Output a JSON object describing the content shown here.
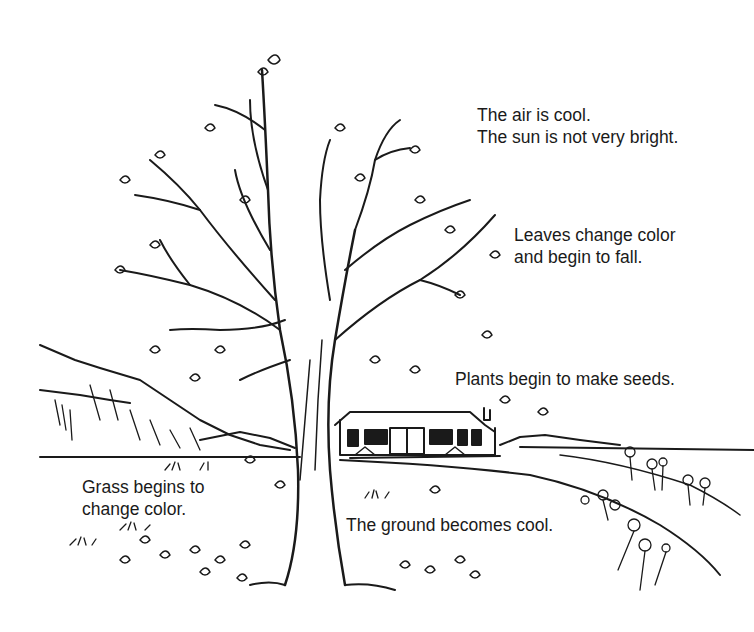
{
  "scene": {
    "subject": "autumn landscape illustration",
    "elements": [
      "bare tree with few leaves",
      "falling leaves",
      "house",
      "hills",
      "flowers",
      "grass"
    ],
    "colors": {
      "ink": "#1a1a1a",
      "background": "#ffffff"
    }
  },
  "labels": {
    "air": {
      "line1": "The air is cool.",
      "line2": "The sun is not very bright."
    },
    "leaves": {
      "line1": "Leaves change color",
      "line2": "and begin to fall."
    },
    "plants": {
      "line1": "Plants begin to make seeds."
    },
    "grass": {
      "line1": "Grass begins to",
      "line2": "change color."
    },
    "ground": {
      "line1": "The ground becomes cool."
    }
  }
}
